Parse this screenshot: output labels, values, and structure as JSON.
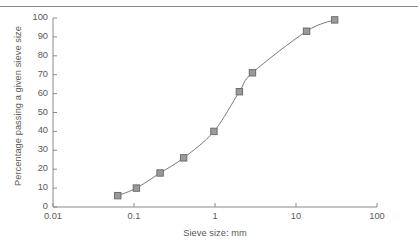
{
  "figure": {
    "name": "particle-size-distribution-chart",
    "background_color": "#ffffff",
    "rule_color": "#8a8a8a",
    "text_color": "#5a5a5a"
  },
  "chart_data": {
    "type": "line",
    "title": "",
    "subtitle": "",
    "xlabel": "Sieve size: mm",
    "ylabel": "Percentage passing a given sieve size",
    "xscale": "log",
    "yscale": "linear",
    "xlim": [
      0.01,
      100
    ],
    "ylim": [
      0,
      100
    ],
    "grid": false,
    "legend": false,
    "legend_position": "none",
    "xticks": [
      0.01,
      0.1,
      1,
      10,
      100
    ],
    "xtick_labels": [
      "0.01",
      "0.1",
      "1",
      "10",
      "100"
    ],
    "yticks": [
      0,
      10,
      20,
      30,
      40,
      50,
      60,
      70,
      80,
      90,
      100
    ],
    "ytick_labels": [
      "0",
      "10",
      "20",
      "30",
      "40",
      "50",
      "60",
      "70",
      "80",
      "90",
      "100"
    ],
    "series": [
      {
        "name": "Grading curve",
        "marker": "square",
        "marker_face_color": "#9a9a9a",
        "marker_edge_color": "#6e6e6e",
        "line_color": "#7a7a7a",
        "x": [
          0.063,
          0.107,
          0.21,
          0.41,
          0.97,
          2.0,
          2.9,
          13.5,
          30.0
        ],
        "y": [
          6,
          10,
          18,
          26,
          40,
          61,
          71,
          93,
          99
        ]
      }
    ]
  },
  "axes_pixels": {
    "x_left": 53,
    "x_right": 377,
    "y_bottom": 207,
    "y_top": 18,
    "decade_px": 81,
    "unit_px": 1.89
  }
}
